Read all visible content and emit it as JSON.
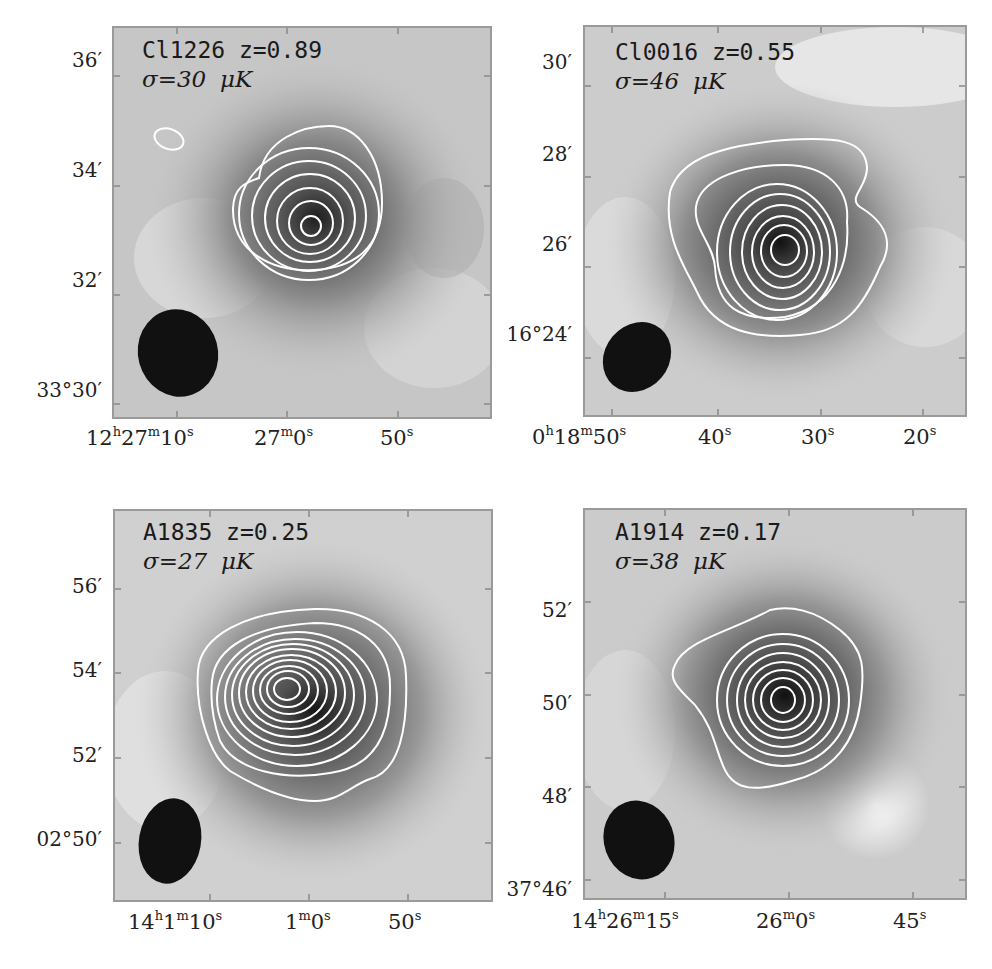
{
  "figure": {
    "panels": [
      {
        "id": "cl1226",
        "cluster": "Cl1226",
        "redshift_label": "z=0.89",
        "title": "Cl1226 z=0.89",
        "sigma_label": "σ=30 μK",
        "sigma_prefix": "σ=30",
        "sigma_unit": "μK",
        "yticks": [
          "36′",
          "34′",
          "32′",
          "33°30′"
        ],
        "xticks": [
          "12h27m10s",
          "27m0s",
          "50s"
        ],
        "xticks_parts": [
          {
            "a": "12",
            "ha": "h",
            "b": "27",
            "hb": "m",
            "c": "10",
            "hc": "s"
          },
          {
            "a": "27",
            "ha": "m",
            "b": "0",
            "hb": "s",
            "c": "",
            "hc": ""
          },
          {
            "a": "50",
            "ha": "s",
            "b": "",
            "hb": "",
            "c": "",
            "hc": ""
          }
        ],
        "contour_count": 7
      },
      {
        "id": "cl0016",
        "cluster": "Cl0016",
        "redshift_label": "z=0.55",
        "title": "Cl0016 z=0.55",
        "sigma_label": "σ=46 μK",
        "sigma_prefix": "σ=46",
        "sigma_unit": "μK",
        "yticks": [
          "30′",
          "28′",
          "26′",
          "16°24′"
        ],
        "xticks": [
          "0h18m50s",
          "40s",
          "30s",
          "20s"
        ],
        "xticks_parts": [
          {
            "a": "0",
            "ha": "h",
            "b": "18",
            "hb": "m",
            "c": "50",
            "hc": "s"
          },
          {
            "a": "40",
            "ha": "s",
            "b": "",
            "hb": "",
            "c": "",
            "hc": ""
          },
          {
            "a": "30",
            "ha": "s",
            "b": "",
            "hb": "",
            "c": "",
            "hc": ""
          },
          {
            "a": "20",
            "ha": "s",
            "b": "",
            "hb": "",
            "c": "",
            "hc": ""
          }
        ],
        "contour_count": 8
      },
      {
        "id": "a1835",
        "cluster": "A1835",
        "redshift_label": "z=0.25",
        "title": "A1835 z=0.25",
        "sigma_label": "σ=27 μK",
        "sigma_prefix": "σ=27",
        "sigma_unit": "μK",
        "yticks": [
          "56′",
          "54′",
          "52′",
          "02°50′"
        ],
        "xticks": [
          "14h1m10s",
          "1m0s",
          "50s"
        ],
        "xticks_parts": [
          {
            "a": "14",
            "ha": "h",
            "b": "1",
            "hb": "m",
            "c": "10",
            "hc": "s"
          },
          {
            "a": "1",
            "ha": "m",
            "b": "0",
            "hb": "s",
            "c": "",
            "hc": ""
          },
          {
            "a": "50",
            "ha": "s",
            "b": "",
            "hb": "",
            "c": "",
            "hc": ""
          }
        ],
        "contour_count": 11
      },
      {
        "id": "a1914",
        "cluster": "A1914",
        "redshift_label": "z=0.17",
        "title": "A1914 z=0.17",
        "sigma_label": "σ=38 μK",
        "sigma_prefix": "σ=38",
        "sigma_unit": "μK",
        "yticks": [
          "52′",
          "50′",
          "48′",
          "37°46′"
        ],
        "xticks": [
          "14h26m15s",
          "26m0s",
          "45s"
        ],
        "xticks_parts": [
          {
            "a": "14",
            "ha": "h",
            "b": "26",
            "hb": "m",
            "c": "15",
            "hc": "s"
          },
          {
            "a": "26",
            "ha": "m",
            "b": "0",
            "hb": "s",
            "c": "",
            "hc": ""
          },
          {
            "a": "45",
            "ha": "s",
            "b": "",
            "hb": "",
            "c": "",
            "hc": ""
          }
        ],
        "contour_count": 8
      }
    ],
    "colors": {
      "background": "#c8c8c8",
      "contour": "#ffffff",
      "beam": "#111111",
      "frame": "#9a9a9a"
    }
  }
}
